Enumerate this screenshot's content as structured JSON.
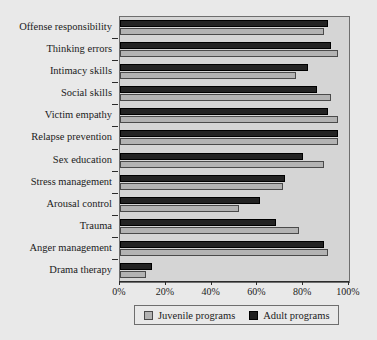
{
  "chart_data": {
    "type": "bar",
    "orientation": "horizontal",
    "title": "",
    "xlabel": "",
    "ylabel": "",
    "xlim": [
      0,
      100
    ],
    "grid": false,
    "legend_position": "bottom",
    "categories": [
      "Offense responsibility",
      "Thinking errors",
      "Intimacy skills",
      "Social skills",
      "Victim empathy",
      "Relapse prevention",
      "Sex education",
      "Stress management",
      "Arousal control",
      "Trauma",
      "Anger management",
      "Drama therapy"
    ],
    "xticklabels": [
      "0%",
      "20%",
      "40%",
      "60%",
      "80%",
      "100%"
    ],
    "xticks": [
      0,
      20,
      40,
      60,
      80,
      100
    ],
    "series": [
      {
        "name": "Juvenile programs",
        "color": "#b3b3b3",
        "values": [
          89,
          95,
          77,
          92,
          95,
          95,
          89,
          71,
          52,
          78,
          91,
          11.5
        ]
      },
      {
        "name": "Adult programs",
        "color": "#232323",
        "values": [
          91,
          92,
          82,
          86,
          91,
          95,
          80,
          72,
          61,
          68,
          89,
          14
        ]
      }
    ]
  },
  "legend": {
    "items": [
      {
        "label": "Juvenile programs",
        "swatch": "juvenile-swatch"
      },
      {
        "label": "Adult programs",
        "swatch": "adult-swatch"
      }
    ]
  },
  "colors": {
    "page_background": "#e9e9e9",
    "plot_background": "#d5d5d5",
    "frame": "#6e6e6e",
    "juvenile": "#b3b3b3",
    "adult": "#232323"
  }
}
